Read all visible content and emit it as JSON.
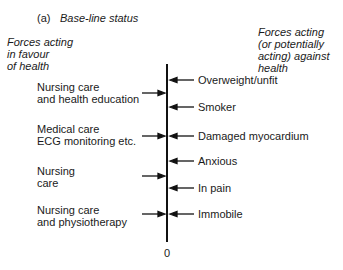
{
  "panel": {
    "label": "(a)",
    "title": "Base-line status"
  },
  "left_header": [
    "Forces acting",
    "in favour",
    "of health"
  ],
  "right_header": [
    "Forces acting",
    "(or potentially",
    "acting) against",
    "health"
  ],
  "left_forces": [
    {
      "lines": [
        "Nursing care",
        "and health education"
      ],
      "arrow_y": 93
    },
    {
      "lines": [
        "Medical care",
        "ECG monitoring etc."
      ],
      "arrow_y": 136
    },
    {
      "lines": [
        "Nursing",
        "care"
      ],
      "arrow_y": 176
    },
    {
      "lines": [
        "Nursing care",
        "and physiotherapy"
      ],
      "arrow_y": 214
    }
  ],
  "right_forces": [
    {
      "label": "Overweight/unfit",
      "arrow_y": 80
    },
    {
      "label": "Smoker",
      "arrow_y": 107
    },
    {
      "label": "Damaged myocardium",
      "arrow_y": 136
    },
    {
      "label": "Anxious",
      "arrow_y": 161
    },
    {
      "label": "In pain",
      "arrow_y": 188
    },
    {
      "label": "Immobile",
      "arrow_y": 214
    }
  ],
  "axis": {
    "zero_label": "0"
  }
}
